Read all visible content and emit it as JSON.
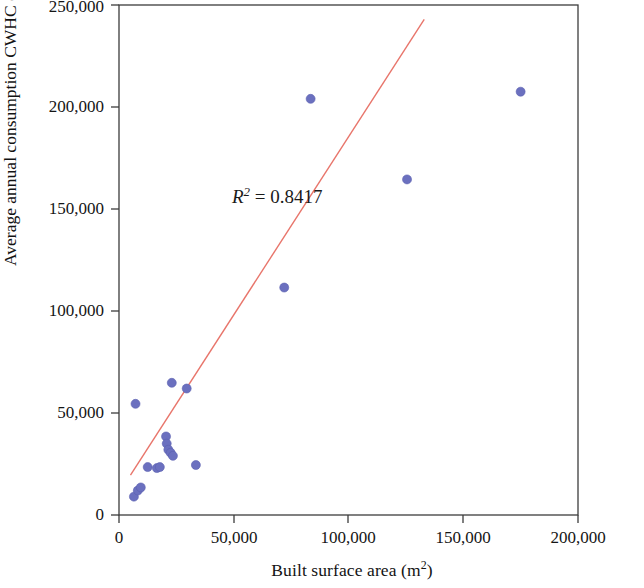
{
  "chart_data": {
    "type": "scatter",
    "title": "",
    "subtitle": "",
    "xlabel": "Built surface area (m2)",
    "xlabel_base": "Built surface area (m",
    "xlabel_sup": "2",
    "xlabel_tail": ")",
    "ylabel": "Average annual consumption CWHC (m3)",
    "ylabel_base": "Average annual consumption CWHC (m",
    "ylabel_sup": "3",
    "ylabel_tail": ")",
    "xlim": [
      0,
      200000
    ],
    "ylim": [
      0,
      250000
    ],
    "xticks": [
      0,
      50000,
      100000,
      150000,
      200000
    ],
    "yticks": [
      0,
      50000,
      100000,
      150000,
      200000,
      250000
    ],
    "xtick_labels": [
      "0",
      "50,000",
      "100,000",
      "150,000",
      "200,000"
    ],
    "ytick_labels": [
      "0",
      "50,000",
      "100,000",
      "150,000",
      "200,000",
      "250,000"
    ],
    "grid": false,
    "legend": false,
    "legend_position": "none",
    "marker_color": "#6b70bf",
    "marker_edge_color": "#5a5fb0",
    "marker_size": 9,
    "series": [
      {
        "name": "Buildings",
        "points": [
          {
            "x": 6500,
            "y": 9000
          },
          {
            "x": 7200,
            "y": 54500
          },
          {
            "x": 8200,
            "y": 12000
          },
          {
            "x": 9500,
            "y": 13500
          },
          {
            "x": 12500,
            "y": 23500
          },
          {
            "x": 16500,
            "y": 23000
          },
          {
            "x": 17800,
            "y": 23500
          },
          {
            "x": 20500,
            "y": 38500
          },
          {
            "x": 20800,
            "y": 35000
          },
          {
            "x": 21500,
            "y": 32000
          },
          {
            "x": 22500,
            "y": 30500
          },
          {
            "x": 23500,
            "y": 29000
          },
          {
            "x": 23000,
            "y": 64800
          },
          {
            "x": 29500,
            "y": 62000
          },
          {
            "x": 33500,
            "y": 24500
          },
          {
            "x": 72000,
            "y": 111500
          },
          {
            "x": 83500,
            "y": 204000
          },
          {
            "x": 125500,
            "y": 164500
          },
          {
            "x": 175000,
            "y": 207500
          }
        ]
      }
    ],
    "trendline": {
      "color": "#e8756b",
      "width": 1.4,
      "x_start": 5000,
      "y_start": 19500,
      "x_end": 133000,
      "y_end": 243000
    },
    "annotations": [
      {
        "name": "r-squared",
        "text": "R2 = 0.8417",
        "symbol": "R",
        "exponent": "2",
        "equals": " = ",
        "value": "0.8417",
        "x": 232,
        "y": 198
      }
    ],
    "axis_color": "#3c3c3c",
    "background": "#ffffff"
  },
  "figure": {
    "plot_left_px": 119,
    "plot_right_px": 578,
    "plot_top_px": 5,
    "plot_bottom_px": 515
  }
}
